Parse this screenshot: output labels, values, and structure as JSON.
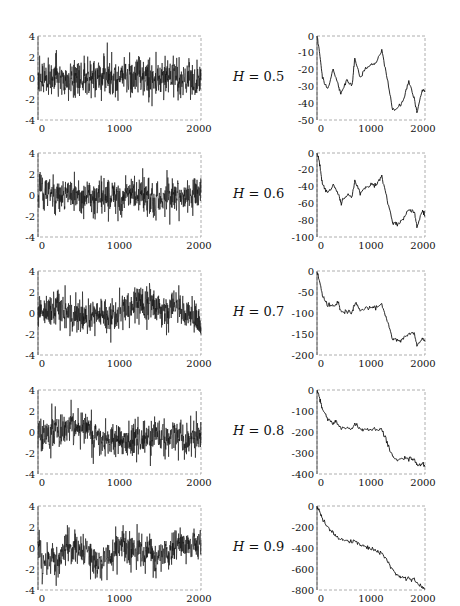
{
  "chart_data": {
    "type": "line",
    "rows": [
      {
        "h_label": "H = 0.5",
        "H": 0.5,
        "left": {
          "xlim": [
            0,
            2000
          ],
          "ylim": [
            -4,
            4
          ],
          "xticks": [
            "0",
            "1000",
            "2000"
          ],
          "yticks": [
            "4",
            "2",
            "0",
            "-2",
            "-4"
          ],
          "kind": "noise",
          "smooth": 0.0,
          "seed": 11
        },
        "right": {
          "xlim": [
            0,
            2000
          ],
          "ylim": [
            -50,
            0
          ],
          "xticks": [
            "0",
            "1000",
            "2000"
          ],
          "yticks": [
            "0",
            "-10",
            "-20",
            "-30",
            "-40",
            "-50"
          ],
          "path": [
            [
              0,
              0
            ],
            [
              50,
              -10
            ],
            [
              100,
              -25
            ],
            [
              200,
              -32
            ],
            [
              300,
              -20
            ],
            [
              400,
              -30
            ],
            [
              450,
              -35
            ],
            [
              550,
              -26
            ],
            [
              650,
              -30
            ],
            [
              700,
              -13
            ],
            [
              800,
              -25
            ],
            [
              900,
              -19
            ],
            [
              1000,
              -17
            ],
            [
              1100,
              -16
            ],
            [
              1200,
              -8
            ],
            [
              1300,
              -25
            ],
            [
              1400,
              -44
            ],
            [
              1500,
              -43
            ],
            [
              1600,
              -38
            ],
            [
              1700,
              -27
            ],
            [
              1800,
              -37
            ],
            [
              1850,
              -46
            ],
            [
              1950,
              -32
            ],
            [
              2000,
              -33
            ]
          ]
        }
      },
      {
        "h_label": "H = 0.6",
        "H": 0.6,
        "left": {
          "xlim": [
            0,
            2000
          ],
          "ylim": [
            -4,
            4
          ],
          "xticks": [
            "0",
            "1000",
            "2000"
          ],
          "yticks": [
            "4",
            "2",
            "0",
            "-2",
            "-4"
          ],
          "kind": "noise",
          "smooth": 0.2,
          "seed": 22
        },
        "right": {
          "xlim": [
            0,
            2000
          ],
          "ylim": [
            -100,
            0
          ],
          "xticks": [
            "0",
            "1000",
            "2000"
          ],
          "yticks": [
            "0",
            "-20",
            "-40",
            "-60",
            "-80",
            "-100"
          ],
          "path": [
            [
              0,
              0
            ],
            [
              50,
              -12
            ],
            [
              100,
              -37
            ],
            [
              200,
              -48
            ],
            [
              300,
              -38
            ],
            [
              400,
              -50
            ],
            [
              450,
              -60
            ],
            [
              550,
              -50
            ],
            [
              650,
              -52
            ],
            [
              700,
              -33
            ],
            [
              800,
              -47
            ],
            [
              900,
              -42
            ],
            [
              1000,
              -38
            ],
            [
              1100,
              -38
            ],
            [
              1200,
              -28
            ],
            [
              1300,
              -55
            ],
            [
              1400,
              -83
            ],
            [
              1500,
              -85
            ],
            [
              1600,
              -78
            ],
            [
              1700,
              -67
            ],
            [
              1800,
              -70
            ],
            [
              1850,
              -88
            ],
            [
              1950,
              -70
            ],
            [
              2000,
              -75
            ]
          ]
        }
      },
      {
        "h_label": "H = 0.7",
        "H": 0.7,
        "left": {
          "xlim": [
            0,
            2000
          ],
          "ylim": [
            -4,
            4
          ],
          "xticks": [
            "0",
            "1000",
            "2000"
          ],
          "yticks": [
            "4",
            "2",
            "0",
            "-2",
            "-4"
          ],
          "kind": "noise",
          "smooth": 0.35,
          "seed": 33
        },
        "right": {
          "xlim": [
            0,
            2000
          ],
          "ylim": [
            -200,
            0
          ],
          "xticks": [
            "0",
            "1000",
            "2000"
          ],
          "yticks": [
            "0",
            "-50",
            "-100",
            "-150",
            "-200"
          ],
          "path": [
            [
              0,
              0
            ],
            [
              50,
              -25
            ],
            [
              100,
              -60
            ],
            [
              200,
              -82
            ],
            [
              300,
              -82
            ],
            [
              400,
              -78
            ],
            [
              450,
              -100
            ],
            [
              550,
              -97
            ],
            [
              650,
              -98
            ],
            [
              700,
              -75
            ],
            [
              800,
              -95
            ],
            [
              900,
              -88
            ],
            [
              1000,
              -87
            ],
            [
              1100,
              -87
            ],
            [
              1200,
              -78
            ],
            [
              1300,
              -120
            ],
            [
              1400,
              -160
            ],
            [
              1500,
              -167
            ],
            [
              1600,
              -160
            ],
            [
              1700,
              -150
            ],
            [
              1800,
              -147
            ],
            [
              1850,
              -178
            ],
            [
              1950,
              -160
            ],
            [
              2000,
              -168
            ]
          ]
        }
      },
      {
        "h_label": "H = 0.8",
        "H": 0.8,
        "left": {
          "xlim": [
            0,
            2000
          ],
          "ylim": [
            -4,
            4
          ],
          "xticks": [
            "0",
            "1000",
            "2000"
          ],
          "yticks": [
            "4",
            "2",
            "0",
            "-2",
            "-4"
          ],
          "kind": "noise",
          "smooth": 0.5,
          "seed": 44
        },
        "right": {
          "xlim": [
            0,
            2000
          ],
          "ylim": [
            -400,
            0
          ],
          "xticks": [
            "0",
            "1000",
            "2000"
          ],
          "yticks": [
            "0",
            "-100",
            "-200",
            "-300",
            "-400"
          ],
          "path": [
            [
              0,
              0
            ],
            [
              50,
              -40
            ],
            [
              100,
              -95
            ],
            [
              200,
              -140
            ],
            [
              300,
              -160
            ],
            [
              350,
              -145
            ],
            [
              450,
              -185
            ],
            [
              550,
              -180
            ],
            [
              650,
              -185
            ],
            [
              700,
              -160
            ],
            [
              800,
              -190
            ],
            [
              900,
              -185
            ],
            [
              1000,
              -188
            ],
            [
              1100,
              -190
            ],
            [
              1200,
              -185
            ],
            [
              1300,
              -250
            ],
            [
              1400,
              -315
            ],
            [
              1500,
              -335
            ],
            [
              1600,
              -330
            ],
            [
              1700,
              -320
            ],
            [
              1800,
              -330
            ],
            [
              1850,
              -360
            ],
            [
              1950,
              -350
            ],
            [
              2000,
              -365
            ]
          ]
        }
      },
      {
        "h_label": "H = 0.9",
        "H": 0.9,
        "left": {
          "xlim": [
            0,
            2000
          ],
          "ylim": [
            -4,
            4
          ],
          "xticks": [
            "0",
            "1000",
            "2000"
          ],
          "yticks": [
            "4",
            "2",
            "0",
            "-2",
            "-4"
          ],
          "kind": "noise",
          "smooth": 0.65,
          "seed": 55
        },
        "right": {
          "xlim": [
            0,
            2000
          ],
          "ylim": [
            -800,
            0
          ],
          "xticks": [
            "0",
            "1000",
            "2000"
          ],
          "yticks": [
            "0",
            "-200",
            "-400",
            "-600",
            "-800"
          ],
          "path": [
            [
              0,
              0
            ],
            [
              50,
              -60
            ],
            [
              100,
              -130
            ],
            [
              200,
              -200
            ],
            [
              300,
              -260
            ],
            [
              400,
              -310
            ],
            [
              500,
              -330
            ],
            [
              600,
              -335
            ],
            [
              700,
              -340
            ],
            [
              800,
              -370
            ],
            [
              900,
              -390
            ],
            [
              1000,
              -410
            ],
            [
              1100,
              -430
            ],
            [
              1200,
              -445
            ],
            [
              1300,
              -520
            ],
            [
              1400,
              -610
            ],
            [
              1500,
              -660
            ],
            [
              1600,
              -680
            ],
            [
              1700,
              -690
            ],
            [
              1800,
              -700
            ],
            [
              1900,
              -760
            ],
            [
              2000,
              -790
            ]
          ]
        }
      }
    ]
  }
}
